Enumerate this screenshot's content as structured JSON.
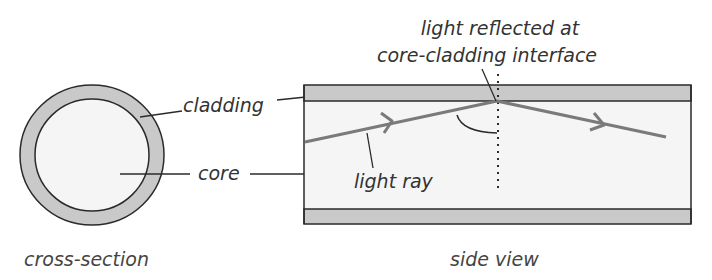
{
  "diagram": {
    "colors": {
      "cladding": "#c9c9c9",
      "core": "#f5f5f5",
      "outline": "#2a2a2a",
      "ray": "#7a7a7a",
      "text": "#333333"
    },
    "cross_section": {
      "caption": "cross-section",
      "labels": {
        "cladding": "cladding",
        "core": "core"
      }
    },
    "side_view": {
      "caption": "side view",
      "labels": {
        "reflection_line1": "light reflected at",
        "reflection_line2": "core-cladding interface",
        "light_ray": "light ray"
      }
    }
  }
}
